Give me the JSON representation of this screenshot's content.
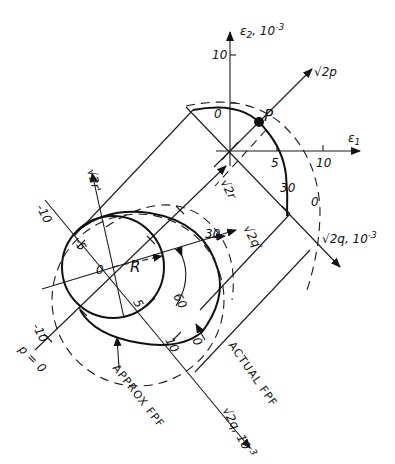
{
  "diagram": {
    "upper_axes": {
      "e2_label": "ε",
      "e2_sub": "2",
      "e2_unit": ", 10",
      "e2_exp": "-3",
      "e2_tick_10": "10",
      "e1_label": "ε",
      "e1_sub": "1",
      "e1_tick_5": "5",
      "e1_tick_10": "10",
      "p_axis_label": "√2p",
      "q_axis_label": "√2q, 10",
      "q_axis_exp": "-3",
      "q_tick_0_top": "0",
      "q_tick_30": "30",
      "q_tick_0_right": "0",
      "point_label": "P"
    },
    "lower_axes": {
      "r_axis_label": "√2r",
      "r_prime_axis_label": "√2r'",
      "q_prime_label": "√2q'",
      "q_axis_label": "√2q, 10",
      "q_axis_exp": "-3",
      "origin_label": "0",
      "radius_label": "R",
      "tick_neg10_upper": "-10",
      "tick_neg5": "-5",
      "tick_neg10_lower": "-10",
      "tick_5": "5",
      "tick_10": "10",
      "tick_0": "0",
      "tick_30": "30",
      "tick_60": "60",
      "p_zero": "p = 0"
    },
    "annotations": {
      "approx": "APPROX FPF",
      "actual": "ACTUAL FPF"
    }
  }
}
